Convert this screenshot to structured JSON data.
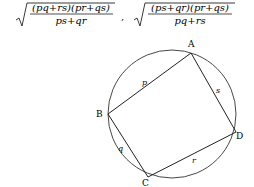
{
  "formulas": [
    {
      "numerator": "(pq+rs)(pr+qs)",
      "denominator": "ps+qr"
    },
    {
      "numerator": "(ps+qr)(pr+qs)",
      "denominator": "pq+rs"
    }
  ],
  "separator": ",",
  "diagram": {
    "vertices": {
      "A": "A",
      "B": "B",
      "C": "C",
      "D": "D"
    },
    "sides": {
      "p": "p",
      "q": "q",
      "r": "r",
      "s": "s"
    }
  }
}
